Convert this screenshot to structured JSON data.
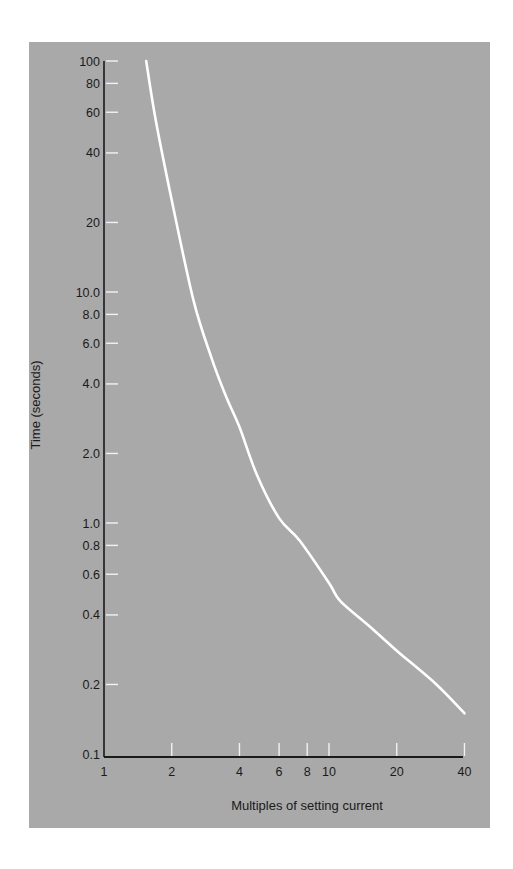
{
  "chart_data": {
    "type": "line",
    "title": "",
    "xlabel": "Multiples of setting current",
    "ylabel": "Time (seconds)",
    "xscale": "log",
    "yscale": "log",
    "xlim": [
      1,
      40
    ],
    "ylim": [
      0.1,
      100
    ],
    "grid": false,
    "legend": null,
    "x_ticks": [
      {
        "value": 1,
        "label": "1"
      },
      {
        "value": 2,
        "label": "2"
      },
      {
        "value": 4,
        "label": "4"
      },
      {
        "value": 6,
        "label": "6"
      },
      {
        "value": 8,
        "label": "8"
      },
      {
        "value": 10,
        "label": "10"
      },
      {
        "value": 20,
        "label": "20"
      },
      {
        "value": 40,
        "label": "40"
      }
    ],
    "y_ticks": [
      {
        "value": 0.1,
        "label": "0.1"
      },
      {
        "value": 0.2,
        "label": "0.2"
      },
      {
        "value": 0.4,
        "label": "0.4"
      },
      {
        "value": 0.6,
        "label": "0.6"
      },
      {
        "value": 0.8,
        "label": "0.8"
      },
      {
        "value": 1.0,
        "label": "1.0"
      },
      {
        "value": 2.0,
        "label": "2.0"
      },
      {
        "value": 4.0,
        "label": "4.0"
      },
      {
        "value": 6.0,
        "label": "6.0"
      },
      {
        "value": 8.0,
        "label": "8.0"
      },
      {
        "value": 10.0,
        "label": "10.0"
      },
      {
        "value": 20,
        "label": "20"
      },
      {
        "value": 40,
        "label": "40"
      },
      {
        "value": 60,
        "label": "60"
      },
      {
        "value": 80,
        "label": "80"
      },
      {
        "value": 100,
        "label": "100"
      }
    ],
    "series": [
      {
        "name": "Inverse time characteristic",
        "color": "#ffffff",
        "x": [
          1.54,
          1.7,
          2.0,
          2.5,
          3.0,
          3.5,
          4.0,
          4.8,
          6.0,
          7.4,
          10.0,
          11.2,
          15.0,
          20.0,
          30.0,
          40.0
        ],
        "y": [
          100,
          55,
          25,
          9.2,
          5.2,
          3.5,
          2.6,
          1.6,
          1.05,
          0.84,
          0.55,
          0.46,
          0.36,
          0.28,
          0.2,
          0.15
        ]
      }
    ]
  },
  "colors": {
    "panel_background": "#a9a9a9",
    "axis": "#1a1a1a",
    "tick_marks": "#f2f2f2",
    "curve": "#ffffff"
  }
}
